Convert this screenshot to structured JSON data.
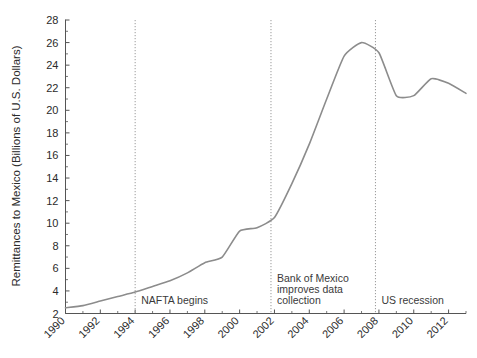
{
  "chart_data": {
    "type": "line",
    "title": "",
    "xlabel": "",
    "ylabel": "Remittances to Mexico (Billions of U.S. Dollars)",
    "xlim": [
      1990,
      2013
    ],
    "ylim": [
      2,
      28
    ],
    "grid": false,
    "legend": "none",
    "ytick_labels": [
      "2",
      "4",
      "6",
      "8",
      "10",
      "12",
      "14",
      "16",
      "18",
      "20",
      "22",
      "24",
      "26",
      "28"
    ],
    "ytick_values": [
      2,
      4,
      6,
      8,
      10,
      12,
      14,
      16,
      18,
      20,
      22,
      24,
      26,
      28
    ],
    "xtick_labels": [
      "1990",
      "1992",
      "1994",
      "1996",
      "1998",
      "2000",
      "2002",
      "2004",
      "2006",
      "2008",
      "2010",
      "2012"
    ],
    "xtick_values": [
      1990,
      1992,
      1994,
      1996,
      1998,
      2000,
      2002,
      2004,
      2006,
      2008,
      2010,
      2012
    ],
    "xtick_minor_values": [
      1991,
      1993,
      1995,
      1997,
      1999,
      2001,
      2003,
      2005,
      2007,
      2009,
      2011,
      2013
    ],
    "line_color": "#8c8c8c",
    "line_width": 1.6,
    "series": [
      {
        "name": "Remittances to Mexico",
        "x": [
          1990,
          1991,
          1992,
          1993,
          1994,
          1995,
          1996,
          1997,
          1998,
          1999,
          2000,
          2001,
          2002,
          2003,
          2004,
          2005,
          2006,
          2007,
          2008,
          2009,
          2010,
          2011,
          2012,
          2013
        ],
        "values": [
          2.5,
          2.7,
          3.1,
          3.5,
          3.9,
          4.4,
          4.9,
          5.6,
          6.5,
          7.0,
          9.3,
          9.6,
          10.5,
          13.5,
          17.0,
          21.0,
          24.8,
          26.0,
          25.1,
          21.3,
          21.3,
          22.8,
          22.4,
          21.5
        ]
      }
    ],
    "annotations": [
      {
        "name": "nafta-begins",
        "label": "NAFTA begins",
        "x": 1994,
        "lines": [
          "NAFTA begins"
        ]
      },
      {
        "name": "bank-of-mexico",
        "label": "Bank of Mexico improves data collection",
        "x": 2001.8,
        "lines": [
          "Bank of Mexico",
          "improves data",
          "collection"
        ]
      },
      {
        "name": "us-recession",
        "label": "US recession",
        "x": 2007.8,
        "lines": [
          "US recession"
        ]
      }
    ],
    "annotation_line_color": "#9a9a9a",
    "axis_color": "#555555"
  }
}
